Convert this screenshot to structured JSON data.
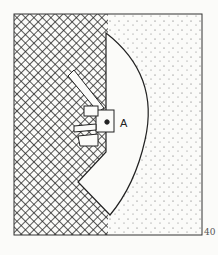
{
  "figure": {
    "label": "A",
    "page_number": "40",
    "regions": [
      "crosshatched-mass",
      "stippled-field",
      "white-fan-shape"
    ],
    "colors": {
      "ink": "#222222",
      "paper": "#fbfbf9"
    }
  }
}
